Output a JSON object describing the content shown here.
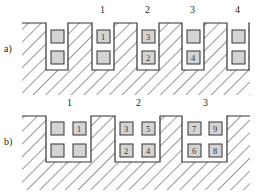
{
  "figure": {
    "part_a": {
      "label": "a)",
      "slot_numbers": [
        "1",
        "2",
        "3",
        "4"
      ],
      "slots": [
        {
          "slot_label": "",
          "cells": [
            {
              "top": ""
            },
            {
              "bottom": ""
            }
          ]
        },
        {
          "slot_label": "1",
          "cells": [
            {
              "top": "1"
            },
            {
              "bottom": ""
            }
          ]
        },
        {
          "slot_label": "2",
          "cells": [
            {
              "top": "3"
            },
            {
              "bottom": "2"
            }
          ]
        },
        {
          "slot_label": "3",
          "cells": [
            {
              "top": ""
            },
            {
              "bottom": "4"
            }
          ]
        },
        {
          "slot_label": "4",
          "cells": [
            {
              "top": ""
            },
            {
              "bottom": ""
            }
          ]
        }
      ]
    },
    "part_b": {
      "label": "b)",
      "slot_numbers": [
        "1",
        "2",
        "3"
      ],
      "slots": [
        {
          "slot_label": "1",
          "cells": {
            "top_left": "",
            "top_right": "1",
            "bottom_left": "",
            "bottom_right": ""
          }
        },
        {
          "slot_label": "2",
          "cells": {
            "top_left": "3",
            "top_right": "5",
            "bottom_left": "2",
            "bottom_right": "4"
          }
        },
        {
          "slot_label": "3",
          "cells": {
            "top_left": "7",
            "top_right": "9",
            "bottom_left": "6",
            "bottom_right": "8"
          }
        }
      ]
    },
    "colors": {
      "line": "#333333",
      "cell_fill": "#d4d4d4",
      "background": "#ffffff"
    }
  }
}
